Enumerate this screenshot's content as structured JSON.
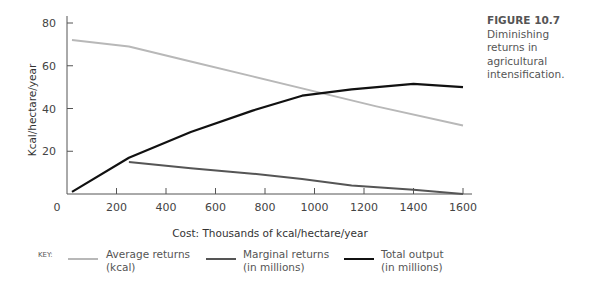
{
  "caption": {
    "figure": "FIGURE 10.7",
    "text": "Diminishing returns in agricultural intensification."
  },
  "key": {
    "title": "KEY:",
    "items": [
      {
        "line1": "Average returns",
        "line2": "(kcal)",
        "color": "#b8b8b8"
      },
      {
        "line1": "Marginal returns",
        "line2": "(in millions)",
        "color": "#555555"
      },
      {
        "line1": "Total output",
        "line2": "(in millions)",
        "color": "#111111"
      }
    ]
  },
  "chart_data": {
    "type": "line",
    "title": "Diminishing returns in agricultural intensification",
    "xlabel": "Cost:  Thousands of kcal/hectare/year",
    "ylabel": "Kcal/hectare/year",
    "xlim": [
      0,
      1600
    ],
    "ylim": [
      0,
      80
    ],
    "x_ticks": [
      0,
      200,
      400,
      600,
      800,
      1000,
      1200,
      1400,
      1600
    ],
    "y_ticks": [
      20,
      40,
      60,
      80
    ],
    "grid": false,
    "legend_position": "bottom",
    "series": [
      {
        "name": "Average returns (kcal)",
        "color": "#b8b8b8",
        "x": [
          20,
          250,
          500,
          750,
          1000,
          1250,
          1600
        ],
        "y": [
          72,
          69,
          62,
          55,
          48,
          41,
          32
        ]
      },
      {
        "name": "Marginal returns (in millions)",
        "color": "#555555",
        "x": [
          250,
          500,
          750,
          950,
          1150,
          1400,
          1600
        ],
        "y": [
          15,
          12,
          9.5,
          7,
          4,
          2,
          0
        ]
      },
      {
        "name": "Total output (in millions)",
        "color": "#111111",
        "x": [
          20,
          250,
          500,
          750,
          950,
          1150,
          1400,
          1600
        ],
        "y": [
          1,
          17,
          29,
          39,
          46,
          49,
          51.5,
          50
        ]
      }
    ]
  }
}
